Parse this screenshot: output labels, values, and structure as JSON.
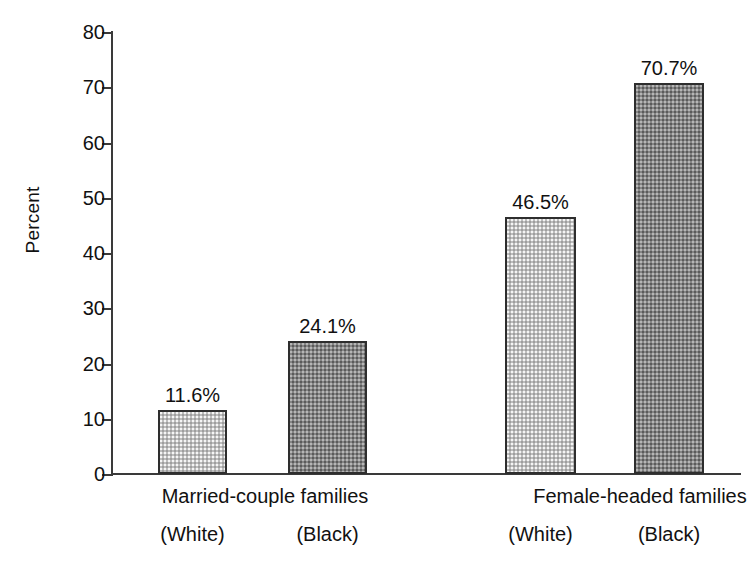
{
  "chart_data": {
    "type": "bar",
    "title": "",
    "subtitle": "",
    "xlabel": "",
    "ylabel": "Percent",
    "ylim": [
      0,
      80
    ],
    "ytick_step": 10,
    "yticks": [
      80,
      70,
      60,
      50,
      40,
      30,
      20,
      10,
      0
    ],
    "ytick_labels": [
      "80",
      "70",
      "60",
      "50",
      "40",
      "30",
      "20",
      "10",
      "0"
    ],
    "grid": false,
    "legend": false,
    "legend_position": "none",
    "categories": [
      "Married-couple families",
      "Female-headed families"
    ],
    "series": [
      {
        "name": "(White)",
        "values": [
          11.6,
          46.5
        ],
        "fill": "light-halftone",
        "color": "#bdbdbd"
      },
      {
        "name": "(Black)",
        "values": [
          24.1,
          70.7
        ],
        "fill": "dark-halftone",
        "color": "#858585"
      }
    ],
    "bars": [
      {
        "group": "Married-couple families",
        "series": "(White)",
        "value": 11.6,
        "label": "11.6%",
        "style": "light"
      },
      {
        "group": "Married-couple families",
        "series": "(Black)",
        "value": 24.1,
        "label": "24.1%",
        "style": "dark"
      },
      {
        "group": "Female-headed families",
        "series": "(White)",
        "value": 46.5,
        "label": "46.5%",
        "style": "light"
      },
      {
        "group": "Female-headed families",
        "series": "(Black)",
        "value": 70.7,
        "label": "70.7%",
        "style": "dark"
      }
    ],
    "data_labels": [
      "11.6%",
      "24.1%",
      "46.5%",
      "70.7%"
    ],
    "group_labels": [
      "Married-couple families",
      "Female-headed families"
    ],
    "series_labels": [
      "(White)",
      "(Black)",
      "(White)",
      "(Black)"
    ],
    "colors": {
      "light_bar": "#bdbdbd",
      "dark_bar": "#858585",
      "bar_outline": "#2e2e2e",
      "axis": "#3a3a3a",
      "text": "#111111",
      "background": "#ffffff"
    }
  }
}
